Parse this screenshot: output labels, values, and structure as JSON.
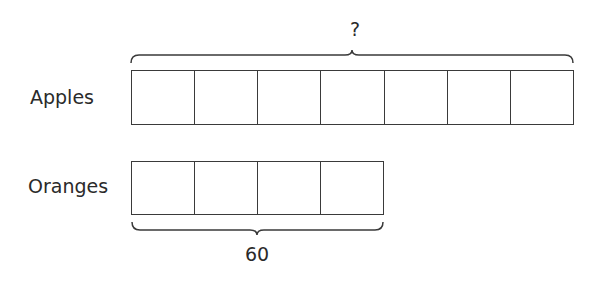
{
  "diagram": {
    "type": "tape-diagram",
    "rows": [
      {
        "label": "Apples",
        "units": 7
      },
      {
        "label": "Oranges",
        "units": 4
      }
    ],
    "annotations": {
      "apples_total": "?",
      "oranges_total": "60"
    },
    "colors": {
      "stroke": "#3a3a3a",
      "text": "#2a2a2a",
      "background": "#ffffff"
    }
  }
}
